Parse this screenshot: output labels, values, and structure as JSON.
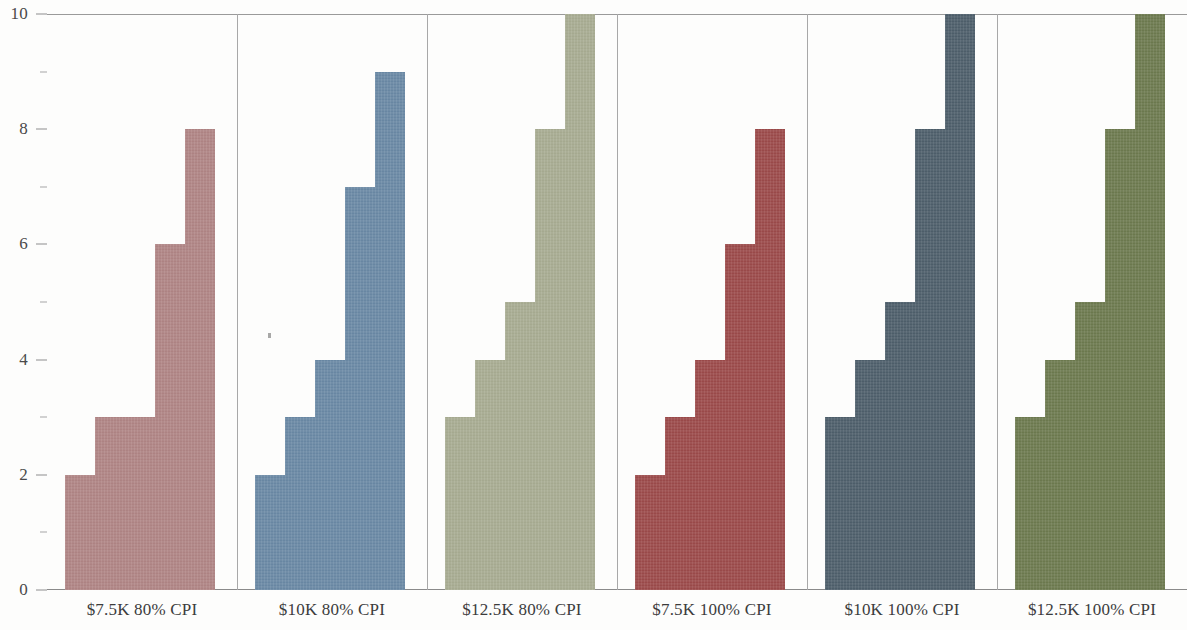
{
  "chart_data": {
    "type": "bar",
    "title": "",
    "subtitle": "",
    "xlabel": "",
    "ylabel": "",
    "ylim": [
      0,
      10
    ],
    "y_major_ticks": [
      0,
      2,
      4,
      6,
      8,
      10
    ],
    "y_minor_ticks": [
      1,
      3,
      5,
      7,
      9
    ],
    "y_tick_labels": [
      "0",
      "2",
      "4",
      "6",
      "8",
      "10"
    ],
    "grid": false,
    "legend": "none",
    "faceted": true,
    "bars_per_facet": 5,
    "categories": [
      "$7.5K 80% CPI",
      "$10K 80% CPI",
      "$12.5K 80% CPI",
      "$7.5K 100% CPI",
      "$10K 100% CPI",
      "$12.5K 100% CPI"
    ],
    "facets": [
      {
        "label": "$7.5K 80% CPI",
        "color": "#b08585",
        "values": [
          2,
          3,
          3,
          6,
          8
        ]
      },
      {
        "label": "$10K 80% CPI",
        "color": "#6a89a5",
        "values": [
          2,
          3,
          4,
          7,
          9
        ]
      },
      {
        "label": "$12.5K 80% CPI",
        "color": "#a8ac92",
        "values": [
          3,
          4,
          5,
          8,
          10
        ]
      },
      {
        "label": "$7.5K 100% CPI",
        "color": "#9c4a4a",
        "values": [
          2,
          3,
          4,
          6,
          8
        ]
      },
      {
        "label": "$10K 100% CPI",
        "color": "#4e5f6b",
        "values": [
          3,
          4,
          5,
          8,
          10
        ]
      },
      {
        "label": "$12.5K 100% CPI",
        "color": "#6d7a4f",
        "values": [
          3,
          4,
          5,
          8,
          10
        ]
      }
    ]
  },
  "axes": {
    "y_axis_name": "y-axis",
    "x_axis_name": "x-axis"
  }
}
